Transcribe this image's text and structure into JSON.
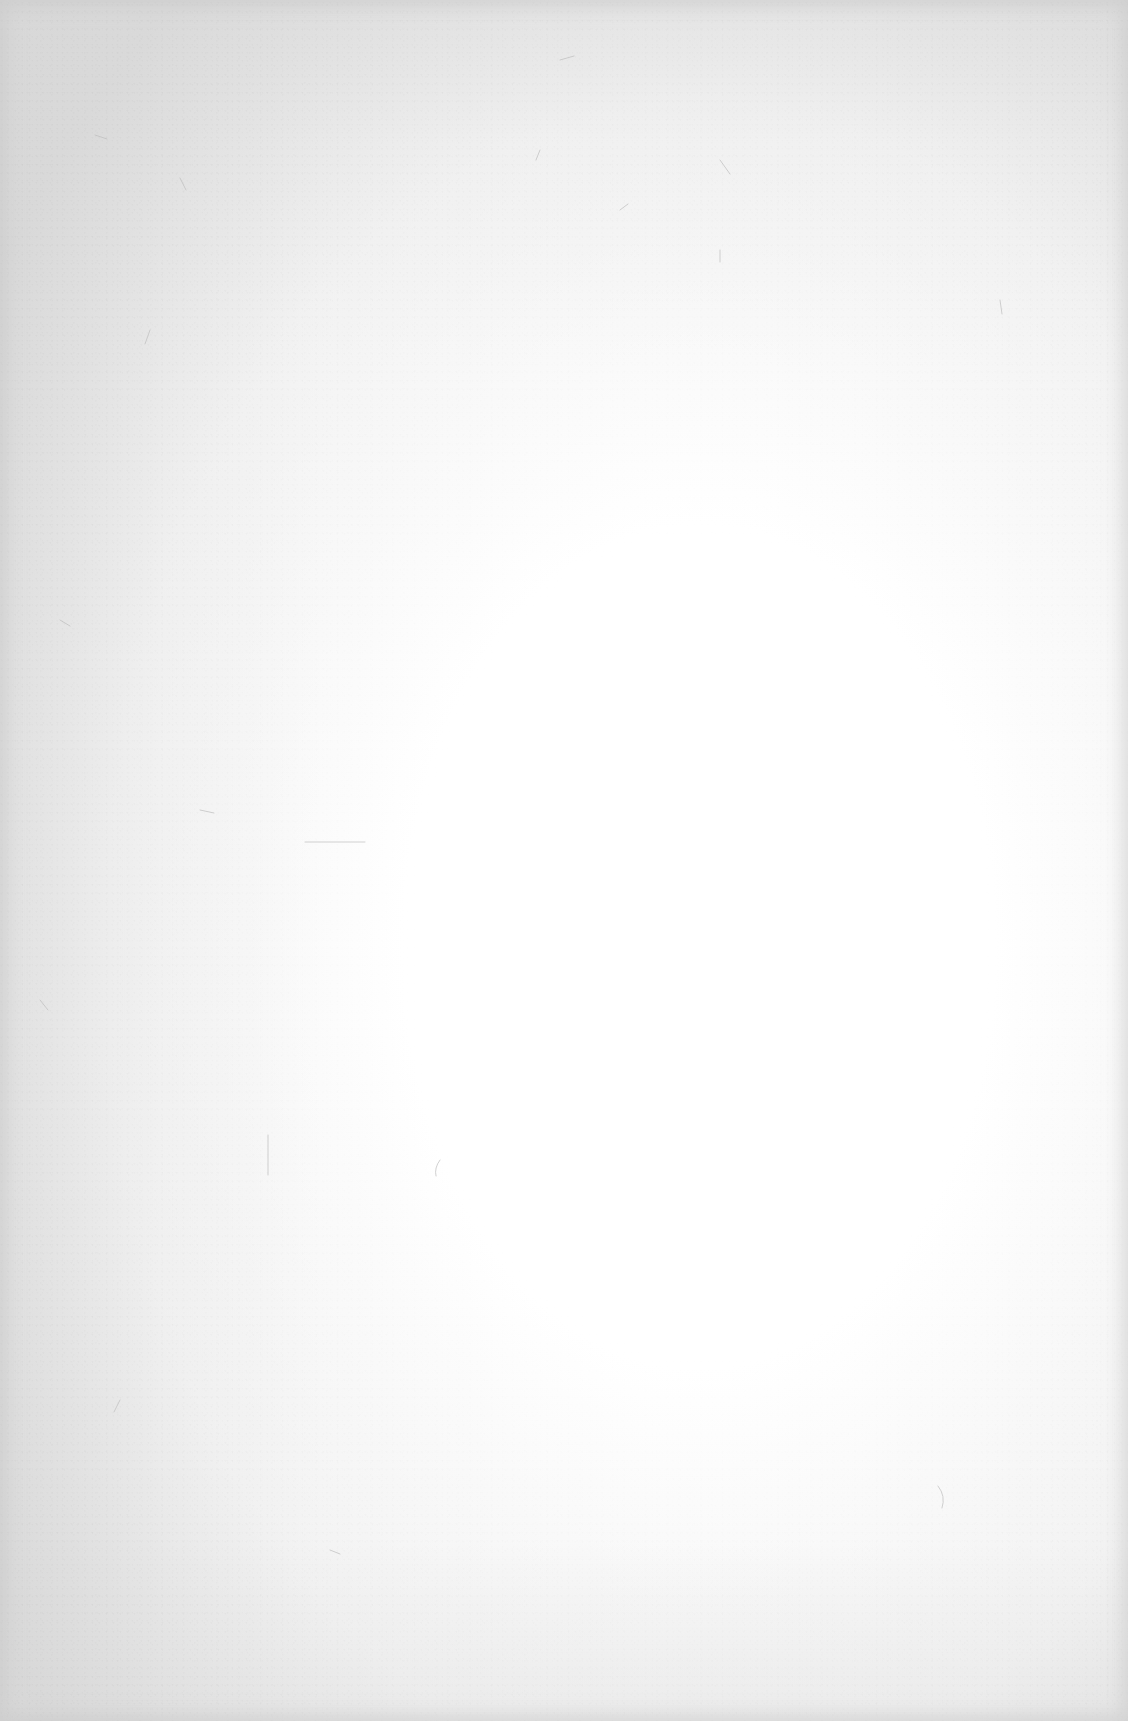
{
  "page": {
    "background_color": "#ffffff",
    "vignette_color": "#d8d8d8"
  }
}
